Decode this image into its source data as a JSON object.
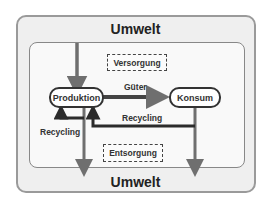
{
  "diagram": {
    "outer_top_label": "Umwelt",
    "outer_bottom_label": "Umwelt",
    "nodes": {
      "produktion": "Produktion",
      "konsum": "Konsum"
    },
    "boxes": {
      "versorgung": "Versorgung",
      "entsorgung": "Entsorgung"
    },
    "edges": {
      "gueter": "Güter",
      "recycling_right": "Recycling",
      "recycling_left": "Recycling"
    },
    "colors": {
      "outer_bg": "#efefef",
      "inner_bg": "#f9f9f9",
      "arrow_gray": "#6f6f6f",
      "arrow_dark": "#2b2b2b",
      "border": "#333333"
    }
  }
}
